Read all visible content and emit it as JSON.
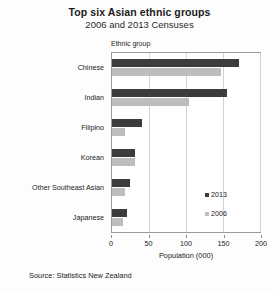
{
  "chart_data": {
    "type": "bar",
    "orientation": "horizontal",
    "title": "Top six Asian ethnic groups",
    "subtitle": "2006 and 2013 Censuses",
    "xlabel": "Population (000)",
    "ylabel": "Ethnic group",
    "xlim": [
      0,
      200
    ],
    "xticks": [
      0,
      50,
      100,
      150,
      200
    ],
    "grid": true,
    "legend_position": "inside-right",
    "categories": [
      "Chinese",
      "Indian",
      "Filipino",
      "Korean",
      "Other Southeast Asian",
      "Japanese"
    ],
    "series": [
      {
        "name": "2013",
        "color": "#3c3c3c",
        "values": [
          171,
          155,
          40,
          31,
          24,
          20
        ]
      },
      {
        "name": "2006",
        "color": "#bdbdbd",
        "values": [
          147,
          104,
          17,
          31,
          17,
          15
        ]
      }
    ],
    "source": "Source: Statistics New Zealand"
  }
}
